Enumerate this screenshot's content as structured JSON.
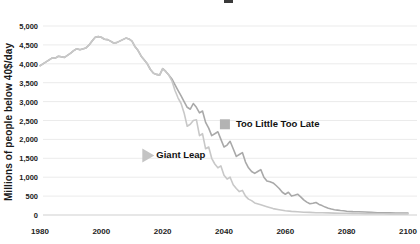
{
  "page": {
    "background": "#ffffff",
    "has_clipped_title_fragment": true
  },
  "y_axis": {
    "label": "Millions of people below 40$/day"
  },
  "chart_data": {
    "type": "line",
    "title": "",
    "xlabel": "",
    "ylabel": "Millions of people below 40$/day",
    "xlim": [
      1980,
      2100
    ],
    "ylim": [
      0,
      5000
    ],
    "grid": true,
    "grid_color": "#ebebeb",
    "axis_color": "#cfcfcf",
    "x_ticks": [
      {
        "v": 1980,
        "label": "1980"
      },
      {
        "v": 2000,
        "label": "2000"
      },
      {
        "v": 2020,
        "label": "2020"
      },
      {
        "v": 2040,
        "label": "2040"
      },
      {
        "v": 2060,
        "label": "2060"
      },
      {
        "v": 2080,
        "label": "2080"
      },
      {
        "v": 2100,
        "label": "2100"
      }
    ],
    "y_ticks": [
      {
        "v": 5000,
        "label": "5,000"
      },
      {
        "v": 4500,
        "label": "4,500"
      },
      {
        "v": 4000,
        "label": "4,000"
      },
      {
        "v": 3500,
        "label": "3,500"
      },
      {
        "v": 3000,
        "label": "3,000"
      },
      {
        "v": 2500,
        "label": "2,500"
      },
      {
        "v": 2000,
        "label": "2,000"
      },
      {
        "v": 1500,
        "label": "1,500"
      },
      {
        "v": 1000,
        "label": "1,000"
      },
      {
        "v": 500,
        "label": "500"
      },
      {
        "v": 0,
        "label": "0"
      }
    ],
    "series": [
      {
        "name": "Too Little Too Late",
        "color": "#a9a9a9",
        "x": [
          1980,
          1982,
          1984,
          1985,
          1986,
          1988,
          1990,
          1991,
          1992,
          1993,
          1995,
          1996,
          1997,
          1998,
          1999,
          2000,
          2001,
          2002,
          2003,
          2004,
          2005,
          2006,
          2007,
          2008,
          2009,
          2010,
          2011,
          2012,
          2013,
          2014,
          2015,
          2016,
          2017,
          2018,
          2019,
          2020,
          2021,
          2022,
          2023,
          2024,
          2025,
          2026,
          2027,
          2028,
          2029,
          2030,
          2031,
          2032,
          2033,
          2034,
          2035,
          2036,
          2037,
          2038,
          2039,
          2040,
          2041,
          2042,
          2043,
          2044,
          2045,
          2046,
          2047,
          2048,
          2049,
          2050,
          2051,
          2052,
          2053,
          2054,
          2055,
          2056,
          2057,
          2058,
          2059,
          2060,
          2061,
          2062,
          2063,
          2064,
          2065,
          2066,
          2067,
          2068,
          2069,
          2070,
          2071,
          2072,
          2073,
          2074,
          2075,
          2076,
          2077,
          2078,
          2079,
          2080,
          2082,
          2084,
          2086,
          2088,
          2090,
          2092,
          2094,
          2096,
          2098,
          2100
        ],
        "values": [
          3950,
          4050,
          4160,
          4150,
          4200,
          4170,
          4280,
          4350,
          4400,
          4370,
          4420,
          4500,
          4600,
          4700,
          4720,
          4700,
          4650,
          4640,
          4600,
          4550,
          4560,
          4600,
          4640,
          4680,
          4660,
          4600,
          4450,
          4350,
          4200,
          4100,
          4000,
          3850,
          3750,
          3720,
          3700,
          3870,
          3800,
          3700,
          3600,
          3450,
          3300,
          3150,
          3000,
          2850,
          2800,
          2950,
          2850,
          2700,
          2750,
          2450,
          2300,
          2100,
          2150,
          2200,
          2000,
          1800,
          1850,
          1950,
          1750,
          1550,
          1600,
          1650,
          1400,
          1250,
          1150,
          1100,
          1150,
          1200,
          1000,
          900,
          880,
          850,
          780,
          700,
          600,
          550,
          600,
          500,
          520,
          550,
          480,
          400,
          340,
          300,
          310,
          330,
          280,
          250,
          210,
          180,
          160,
          140,
          130,
          120,
          110,
          100,
          90,
          85,
          80,
          70,
          60,
          58,
          55,
          52,
          50,
          50
        ]
      },
      {
        "name": "Giant Leap",
        "color": "#c8c8c8",
        "x": [
          1980,
          1982,
          1984,
          1985,
          1986,
          1988,
          1990,
          1991,
          1992,
          1993,
          1995,
          1996,
          1997,
          1998,
          1999,
          2000,
          2001,
          2002,
          2003,
          2004,
          2005,
          2006,
          2007,
          2008,
          2009,
          2010,
          2011,
          2012,
          2013,
          2014,
          2015,
          2016,
          2017,
          2018,
          2019,
          2020,
          2021,
          2022,
          2023,
          2024,
          2025,
          2026,
          2027,
          2028,
          2029,
          2030,
          2031,
          2032,
          2033,
          2034,
          2035,
          2036,
          2037,
          2038,
          2039,
          2040,
          2041,
          2042,
          2043,
          2044,
          2045,
          2046,
          2047,
          2048,
          2049,
          2050,
          2052,
          2054,
          2056,
          2058,
          2060,
          2062,
          2064,
          2066,
          2068,
          2070,
          2072,
          2074,
          2076,
          2078,
          2080,
          2082,
          2084,
          2086,
          2088,
          2090,
          2092,
          2094,
          2096,
          2098,
          2100
        ],
        "values": [
          3950,
          4050,
          4160,
          4150,
          4200,
          4170,
          4280,
          4350,
          4400,
          4370,
          4420,
          4500,
          4600,
          4700,
          4720,
          4700,
          4650,
          4640,
          4600,
          4550,
          4560,
          4600,
          4640,
          4680,
          4660,
          4600,
          4450,
          4350,
          4200,
          4100,
          4000,
          3850,
          3750,
          3720,
          3700,
          3870,
          3800,
          3700,
          3550,
          3300,
          3100,
          2950,
          2700,
          2350,
          2400,
          2500,
          2520,
          2100,
          2150,
          1750,
          1800,
          1500,
          1350,
          1250,
          1300,
          1050,
          950,
          1000,
          800,
          700,
          620,
          650,
          500,
          420,
          380,
          320,
          270,
          220,
          170,
          140,
          110,
          95,
          85,
          75,
          68,
          62,
          58,
          55,
          50,
          48,
          45,
          42,
          40,
          38,
          36,
          34,
          32,
          30,
          30,
          28,
          28
        ]
      }
    ],
    "annotations": [
      {
        "label": "Too Little Too Late",
        "marker": "square",
        "marker_color": "#b3b3b3",
        "year": 2040.3,
        "value": 2400
      },
      {
        "label": "Giant Leap",
        "marker": "triangle-right",
        "marker_color": "#c4c4c4",
        "year": 2015.0,
        "value": 1575
      }
    ],
    "legend_position": "inline-annotations"
  }
}
